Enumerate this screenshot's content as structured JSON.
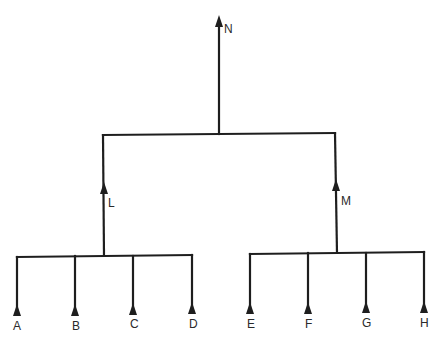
{
  "diagram": {
    "type": "tree",
    "root": {
      "label": "N"
    },
    "intermediate": [
      {
        "label": "L",
        "children": [
          "A",
          "B",
          "C",
          "D"
        ]
      },
      {
        "label": "M",
        "children": [
          "E",
          "F",
          "G",
          "H"
        ]
      }
    ],
    "leaves": [
      {
        "label": "A"
      },
      {
        "label": "B"
      },
      {
        "label": "C"
      },
      {
        "label": "D"
      },
      {
        "label": "E"
      },
      {
        "label": "F"
      },
      {
        "label": "G"
      },
      {
        "label": "H"
      }
    ],
    "colors": {
      "line": "#1e1e1e",
      "background": "#ffffff"
    }
  }
}
